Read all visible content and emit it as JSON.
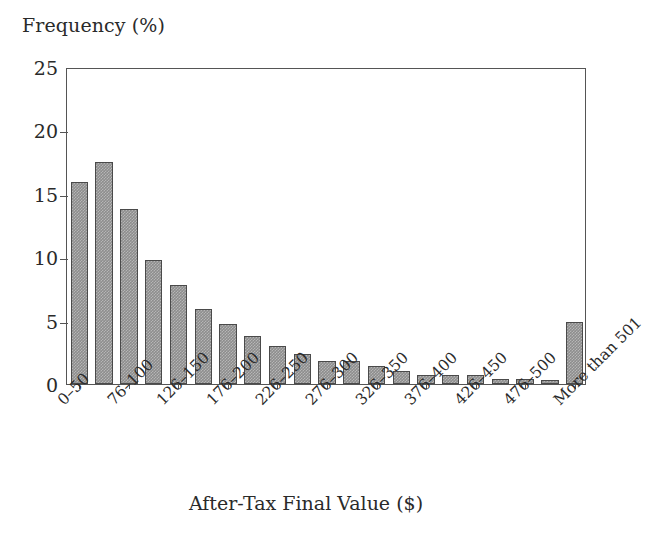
{
  "chart_data": {
    "type": "bar",
    "title": "",
    "ylabel": "Frequency (%)",
    "xlabel": "After-Tax Final Value ($)",
    "ylim": [
      0,
      25
    ],
    "yticks": [
      0,
      5,
      10,
      15,
      20,
      25
    ],
    "ytick_labels": [
      "0",
      "5",
      "10",
      "15",
      "20",
      "25"
    ],
    "grid": false,
    "legend": null,
    "bar_color": "#8d8d8d",
    "bar_edge_color": "#4a4a4a",
    "categories": [
      "0–50",
      "51–75",
      "76–100",
      "101–125",
      "126–150",
      "151–175",
      "176–200",
      "201–225",
      "226–250",
      "251–275",
      "276–300",
      "301–325",
      "326–350",
      "351–375",
      "376–400",
      "401–425",
      "426–450",
      "451–475",
      "476–500",
      "501–525",
      "More than 501"
    ],
    "values": [
      15.9,
      17.5,
      13.8,
      9.8,
      7.8,
      5.9,
      4.7,
      3.8,
      3.0,
      2.4,
      1.8,
      1.8,
      1.4,
      1.0,
      0.7,
      0.7,
      0.7,
      0.4,
      0.4,
      0.35,
      4.9
    ],
    "xtick_labels": [
      "0–50",
      "76–100",
      "126–150",
      "176–200",
      "226–250",
      "276–300",
      "326–350",
      "376–400",
      "426–450",
      "476–500",
      "More than 501"
    ],
    "xtick_bar_indices": [
      0,
      2,
      4,
      6,
      8,
      10,
      12,
      14,
      16,
      18,
      20
    ]
  }
}
